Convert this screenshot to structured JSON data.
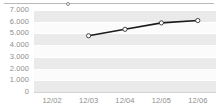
{
  "chart_data": {
    "type": "line",
    "title": "",
    "xlabel": "",
    "ylabel": "",
    "categories": [
      "12/02",
      "12/03",
      "12/04",
      "12/05",
      "12/06"
    ],
    "series": [
      {
        "name": "series-1",
        "values": [
          null,
          4800,
          5350,
          5900,
          6100
        ]
      }
    ],
    "ylim": [
      0,
      7000
    ],
    "ytick_labels": [
      "7.000",
      "6.000",
      "5.000",
      "4.000",
      "3.000",
      "2.000",
      "1.000",
      "0"
    ],
    "ytick_values": [
      7000,
      6000,
      5000,
      4000,
      3000,
      2000,
      1000,
      0
    ],
    "xtick_labels": [
      "12/02",
      "12/03",
      "12/04",
      "12/05",
      "12/06"
    ],
    "grid": true,
    "legend": "top",
    "marker": "circle-open",
    "colors": {
      "line": "#1a1a1a",
      "marker_fill": "#ffffff",
      "marker_stroke": "#333333",
      "band": "#eaeaea",
      "plot_background": "#fbfbfb",
      "gridline": "#ffffff",
      "tick_label": "#8e8e8e",
      "axis": "#d2d2d2"
    }
  },
  "legend_strip": {
    "marker_name": "series-marker"
  }
}
